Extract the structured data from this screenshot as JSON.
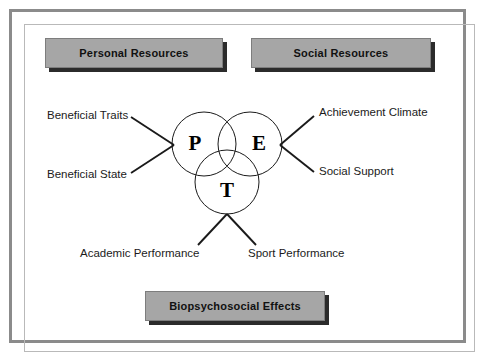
{
  "figure": {
    "type": "venn-concept-diagram",
    "title_boxes": {
      "top_left": "Personal Resources",
      "top_right": "Social Resources",
      "bottom_center": "Biopsychosocial Effects"
    },
    "venn": {
      "circles": [
        {
          "id": "p",
          "letter": "P",
          "meaning_group": "personal"
        },
        {
          "id": "e",
          "letter": "E",
          "meaning_group": "environment"
        },
        {
          "id": "t",
          "letter": "T",
          "meaning_group": "task"
        }
      ]
    },
    "labels": {
      "beneficial_traits": "Beneficial Traits",
      "beneficial_state": "Beneficial State",
      "achievement_climate": "Achievement Climate",
      "social_support": "Social Support",
      "academic_performance": "Academic Performance",
      "sport_performance": "Sport Performance"
    },
    "colors": {
      "box_fill": "#a6a6a6",
      "box_border": "#7d7d7d",
      "box_shadow": "#2b2b2b",
      "frame": "#8b8b8b",
      "ink": "#1a1a1a",
      "background": "#ffffff"
    }
  }
}
